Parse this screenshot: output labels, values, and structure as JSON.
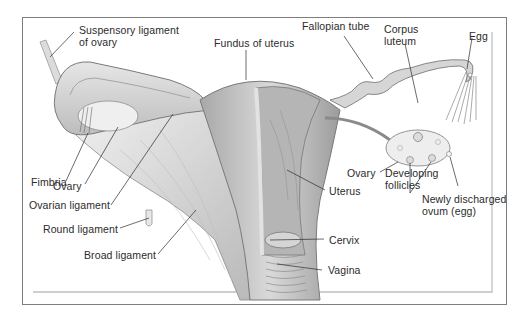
{
  "figure": {
    "labels": {
      "suspensory_ligament": "Suspensory ligament\nof ovary",
      "fundus": "Fundus of uterus",
      "fallopian_tube": "Fallopian tube",
      "corpus_luteum": "Corpus\nluteum",
      "egg": "Egg",
      "fimbria": "Fimbria",
      "ovary_left": "Ovary",
      "ovarian_ligament": "Ovarian ligament",
      "round_ligament": "Round ligament",
      "broad_ligament": "Broad ligament",
      "uterus": "Uterus",
      "cervix": "Cervix",
      "vagina": "Vagina",
      "ovary_right": "Ovary",
      "developing_follicles": "Developing\nfollicles",
      "newly_discharged_ovum": "Newly discharged\novum (egg)"
    },
    "colors": {
      "frame": "#7d7d7d",
      "tissue_light": "#e9e9e9",
      "tissue_mid": "#c8c8c8",
      "tissue_dark": "#8e8e8e",
      "leader_line": "#2b2b2b"
    }
  }
}
